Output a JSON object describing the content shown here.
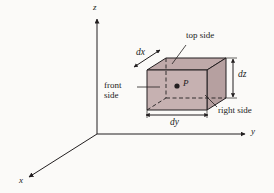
{
  "figure": {
    "background_color": "#fbfaf8",
    "line_color": "#231f20",
    "box_fill_color": "#c3aeae",
    "box_top_fill_color": "#bfa9a9",
    "box_right_fill_color": "#b8a2a2"
  },
  "axes": {
    "x_label": "x",
    "y_label": "y",
    "z_label": "z"
  },
  "box": {
    "point_label": "P",
    "dimensions": [
      {
        "key": "dx",
        "label": "dx"
      },
      {
        "key": "dy",
        "label": "dy"
      },
      {
        "key": "dz",
        "label": "dz"
      }
    ],
    "faces": [
      {
        "key": "top",
        "label": "top side"
      },
      {
        "key": "front",
        "label_line1": "front",
        "label_line2": "side"
      },
      {
        "key": "right",
        "label": "right side"
      }
    ]
  }
}
